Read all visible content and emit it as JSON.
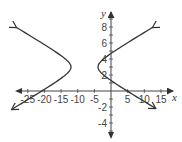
{
  "chart_data": {
    "type": "line",
    "title": "",
    "xlabel": "x",
    "ylabel": "y",
    "xlim": [
      -27,
      18
    ],
    "ylim": [
      -5.5,
      10
    ],
    "x_ticks": [
      -25,
      -20,
      -15,
      -10,
      -5,
      5,
      10,
      15
    ],
    "y_ticks": [
      8,
      6,
      4,
      2,
      -2,
      -4
    ],
    "grid": false,
    "legend": null,
    "series": [
      {
        "name": "hyperbola",
        "description": "Horizontal hyperbola centered near (-8, 3), vertices near (-12, 3) and (-4, 3), both branches ending in arrows",
        "center": [
          -8,
          3
        ],
        "vertices": [
          [
            -12,
            3
          ],
          [
            -4,
            3
          ]
        ],
        "left_branch_endpoints": [
          [
            -29,
            8
          ],
          [
            -28,
            -2.2
          ]
        ],
        "right_branch_endpoints": [
          [
            12.5,
            8
          ],
          [
            13,
            -2.1
          ]
        ],
        "right_branch_y_intercepts": [
          4.1,
          1.8
        ],
        "color": "#333333"
      }
    ]
  },
  "axes": {
    "x_label": "x",
    "y_label": "y",
    "x_tick_labels": [
      "-25",
      "-20",
      "-15",
      "-10",
      "-5",
      "5",
      "10",
      "15"
    ],
    "y_tick_labels": [
      "8",
      "6",
      "4",
      "2",
      "-2",
      "-4"
    ]
  }
}
